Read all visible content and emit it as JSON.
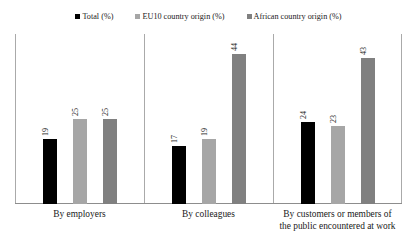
{
  "chart_data": {
    "type": "bar",
    "title": "",
    "subtitle": "",
    "xlabel": "",
    "ylabel": "",
    "ylim": [
      0,
      50
    ],
    "grid": false,
    "legend_position": "top-center",
    "categories": [
      "By employers",
      "By colleagues",
      "By customers or members of the public encountered at work"
    ],
    "series": [
      {
        "name": "Total (%)",
        "color": "#000000",
        "values": [
          19,
          17,
          24
        ]
      },
      {
        "name": "EU10 country origin (%)",
        "color": "#a6a6a6",
        "values": [
          25,
          19,
          23
        ]
      },
      {
        "name": "African country origin (%)",
        "color": "#808080",
        "values": [
          25,
          44,
          43
        ]
      }
    ]
  },
  "legend": {
    "items": [
      {
        "label": "Total (%)",
        "color": "#000000"
      },
      {
        "label": "EU10 country origin (%)",
        "color": "#a6a6a6"
      },
      {
        "label": "African country origin (%)",
        "color": "#808080"
      }
    ]
  }
}
